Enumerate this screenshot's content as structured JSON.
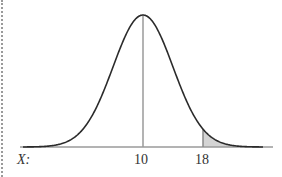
{
  "figure": {
    "axis_label": "X:",
    "tick_labels": [
      "10",
      "18"
    ],
    "colors": {
      "curve": "#2b2b2b",
      "axis": "#9a9a9a",
      "mean_line": "#9a9a9a",
      "shade_fill": "#d4d4d4",
      "shade_edge": "#8a8a8a",
      "border": "#9a9a9a"
    }
  },
  "chart_data": {
    "type": "area",
    "title": "",
    "xlabel": "X:",
    "ylabel": "",
    "distribution": "normal",
    "mean": 10,
    "std_dev_estimate": 4,
    "marked_values": [
      10,
      18
    ],
    "shaded_region": {
      "from": 18,
      "to": "infinity",
      "side": "right-tail"
    },
    "vertical_lines_at": [
      10,
      18
    ],
    "x_ticks": [
      10,
      18
    ],
    "grid": false,
    "legend": null
  }
}
